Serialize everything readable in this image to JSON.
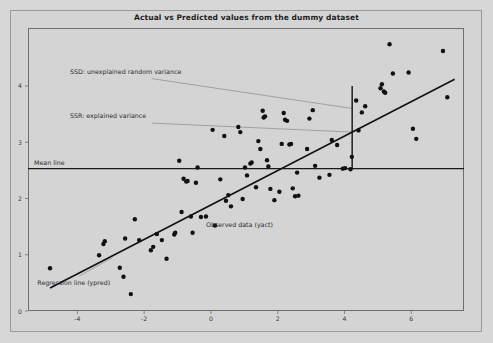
{
  "figure": {
    "background_color": "#d7d7d7",
    "plot_border_color": "#6f6f6f"
  },
  "chart_data": {
    "type": "scatter",
    "title": "Actual vs Predicted values from the dummy dataset",
    "xlabel": "",
    "ylabel": "",
    "xlim": [
      -5.48,
      7.58
    ],
    "ylim": [
      0.0,
      5.03
    ],
    "xticks": [
      -4,
      -2,
      0,
      2,
      4,
      6
    ],
    "xtick_labels": [
      "-4",
      "-2",
      "0",
      "2",
      "4",
      "6"
    ],
    "yticks": [
      0,
      1,
      2,
      3,
      4
    ],
    "ytick_labels": [
      "0",
      "1",
      "2",
      "3",
      "4"
    ],
    "grid": false,
    "legend": "none",
    "marker_color": "#111111",
    "marker_size": 3.2,
    "series": [
      {
        "name": "Observed data (yact)",
        "type": "scatter",
        "points": [
          [
            -4.82,
            0.76
          ],
          [
            -3.35,
            0.99
          ],
          [
            -3.22,
            1.19
          ],
          [
            -3.18,
            1.24
          ],
          [
            -2.73,
            0.77
          ],
          [
            -2.62,
            0.61
          ],
          [
            -2.57,
            1.29
          ],
          [
            -2.4,
            0.3
          ],
          [
            -2.28,
            1.63
          ],
          [
            -2.15,
            1.26
          ],
          [
            -1.8,
            1.08
          ],
          [
            -1.73,
            1.14
          ],
          [
            -1.62,
            1.37
          ],
          [
            -1.47,
            1.26
          ],
          [
            -1.33,
            0.93
          ],
          [
            -1.1,
            1.36
          ],
          [
            -1.07,
            1.39
          ],
          [
            -0.95,
            2.67
          ],
          [
            -0.88,
            1.76
          ],
          [
            -0.82,
            2.35
          ],
          [
            -0.74,
            2.3
          ],
          [
            -0.7,
            2.31
          ],
          [
            -0.6,
            1.68
          ],
          [
            -0.55,
            1.39
          ],
          [
            -0.45,
            2.28
          ],
          [
            -0.4,
            2.55
          ],
          [
            -0.3,
            1.67
          ],
          [
            -0.15,
            1.68
          ],
          [
            0.05,
            3.22
          ],
          [
            0.12,
            1.52
          ],
          [
            0.28,
            2.34
          ],
          [
            0.4,
            3.11
          ],
          [
            0.45,
            1.96
          ],
          [
            0.52,
            2.06
          ],
          [
            0.6,
            1.86
          ],
          [
            0.82,
            3.27
          ],
          [
            0.88,
            3.18
          ],
          [
            0.95,
            1.99
          ],
          [
            1.02,
            2.55
          ],
          [
            1.08,
            2.41
          ],
          [
            1.18,
            2.62
          ],
          [
            1.22,
            2.64
          ],
          [
            1.35,
            2.2
          ],
          [
            1.42,
            3.02
          ],
          [
            1.48,
            2.88
          ],
          [
            1.55,
            3.56
          ],
          [
            1.58,
            3.44
          ],
          [
            1.62,
            3.46
          ],
          [
            1.68,
            2.68
          ],
          [
            1.72,
            2.57
          ],
          [
            1.78,
            2.17
          ],
          [
            1.9,
            1.97
          ],
          [
            2.05,
            2.12
          ],
          [
            2.12,
            2.97
          ],
          [
            2.18,
            3.52
          ],
          [
            2.22,
            3.4
          ],
          [
            2.28,
            3.38
          ],
          [
            2.35,
            2.96
          ],
          [
            2.4,
            2.97
          ],
          [
            2.45,
            2.18
          ],
          [
            2.52,
            2.04
          ],
          [
            2.58,
            2.46
          ],
          [
            2.62,
            2.05
          ],
          [
            2.88,
            2.88
          ],
          [
            2.95,
            3.42
          ],
          [
            3.05,
            3.57
          ],
          [
            3.12,
            2.58
          ],
          [
            3.25,
            2.37
          ],
          [
            3.55,
            2.42
          ],
          [
            3.62,
            3.04
          ],
          [
            3.78,
            2.95
          ],
          [
            3.95,
            2.53
          ],
          [
            4.02,
            2.54
          ],
          [
            4.18,
            2.52
          ],
          [
            4.22,
            2.74
          ],
          [
            4.35,
            3.74
          ],
          [
            4.42,
            3.21
          ],
          [
            4.52,
            3.53
          ],
          [
            4.62,
            3.64
          ],
          [
            5.08,
            3.96
          ],
          [
            5.12,
            4.03
          ],
          [
            5.18,
            3.9
          ],
          [
            5.22,
            3.88
          ],
          [
            5.35,
            4.74
          ],
          [
            5.45,
            4.22
          ],
          [
            5.92,
            4.24
          ],
          [
            6.05,
            3.24
          ],
          [
            6.15,
            3.06
          ],
          [
            6.95,
            4.62
          ],
          [
            7.08,
            3.8
          ]
        ]
      }
    ],
    "reference_lines": [
      {
        "name": "Regression line (ypred)",
        "type": "line",
        "points": [
          [
            -4.82,
            0.41
          ],
          [
            7.3,
            4.12
          ]
        ],
        "color": "#111111",
        "width": 1.6
      },
      {
        "name": "Mean line",
        "type": "hline",
        "y": 2.53,
        "x_range": [
          -5.48,
          7.58
        ],
        "color": "#1a1a1a",
        "width": 1.2
      },
      {
        "name": "variance-marker",
        "type": "vline",
        "x": 4.23,
        "y_range": [
          2.53,
          4.0
        ],
        "color": "#111111",
        "width": 1.4
      }
    ],
    "annotations": [
      {
        "id": "ssd",
        "text": "SSD: unexplained random variance",
        "text_x": -4.22,
        "text_y": 4.25,
        "leader_to_x": 4.23,
        "leader_to_y": 3.6,
        "color": "#2b2b2b"
      },
      {
        "id": "ssr",
        "text": "SSR: explained variance",
        "text_x": -4.22,
        "text_y": 3.46,
        "leader_to_x": 4.23,
        "leader_to_y": 3.18,
        "color": "#2b2b2b"
      },
      {
        "id": "mean-line",
        "text": "Mean line",
        "text_x": -5.3,
        "text_y": 2.63,
        "color": "#2b2b2b"
      },
      {
        "id": "observed-data",
        "text": "Observed data (yact)",
        "text_x": -0.15,
        "text_y": 1.53,
        "color": "#2b2b2b"
      },
      {
        "id": "regression-line",
        "text": "Regression line (ypred)",
        "text_x": -5.2,
        "text_y": 0.5,
        "leader_from_x": -3.95,
        "leader_from_y": 0.62,
        "leader_to_x": -2.95,
        "leader_to_y": 0.95,
        "color": "#2b2b2b"
      }
    ]
  }
}
